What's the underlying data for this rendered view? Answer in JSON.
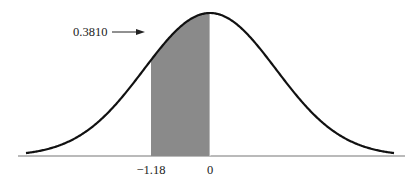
{
  "diagram": {
    "type": "normal-distribution-shaded-area",
    "area_label": "0.3810",
    "shade_from_z": -1.18,
    "shade_to_z": 0,
    "tick_labels": [
      {
        "z": -1.18,
        "text": "−1.18"
      },
      {
        "z": 0,
        "text": "0"
      }
    ],
    "colors": {
      "curve": "#111111",
      "shade": "#8a8a8a",
      "axis": "#777777",
      "text": "#222222"
    }
  }
}
